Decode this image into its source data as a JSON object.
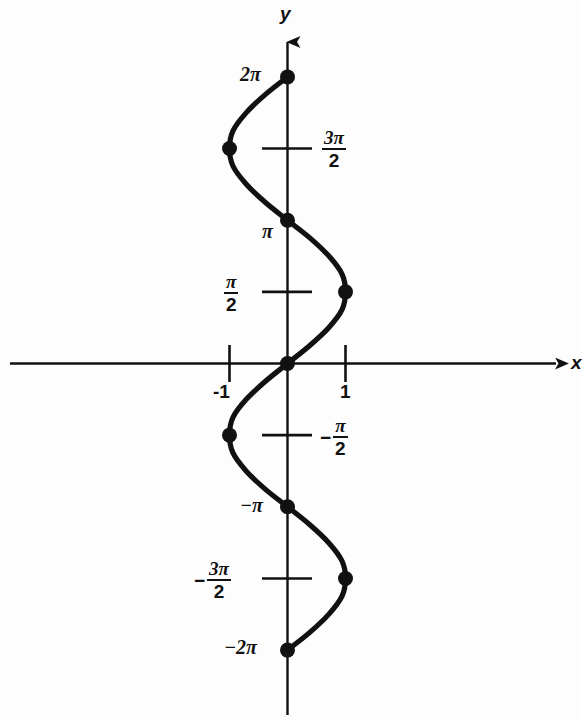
{
  "figure": {
    "background_color": "#fdfdfd",
    "ink_color": "#111111"
  },
  "axes": {
    "x_axis_label": "x",
    "y_axis_label": "y",
    "x_axis_has_arrow_right": true,
    "y_axis_has_arrow_up": true
  },
  "x_ticks": [
    {
      "label": "-1",
      "value": -1
    },
    {
      "label": "1",
      "value": 1
    }
  ],
  "y_ticks": [
    {
      "id": "two-pi",
      "text": "2π",
      "value": 6.2832,
      "kind": "plain"
    },
    {
      "id": "three-pi-over-two",
      "numerator": "3π",
      "denominator": "2",
      "value": 4.7124,
      "kind": "fraction"
    },
    {
      "id": "pi",
      "text": "π",
      "value": 3.1416,
      "kind": "plain"
    },
    {
      "id": "pi-over-two",
      "numerator": "π",
      "denominator": "2",
      "value": 1.5708,
      "kind": "fraction"
    },
    {
      "id": "neg-pi-over-two",
      "sign": "−",
      "numerator": "π",
      "denominator": "2",
      "value": -1.5708,
      "kind": "fraction"
    },
    {
      "id": "neg-pi",
      "text": "−π",
      "value": -3.1416,
      "kind": "plain"
    },
    {
      "id": "neg-three-pi-over-two",
      "sign": "−",
      "numerator": "3π",
      "denominator": "2",
      "value": -4.7124,
      "kind": "fraction"
    },
    {
      "id": "neg-two-pi",
      "text": "−2π",
      "value": -6.2832,
      "kind": "plain"
    }
  ],
  "chart_data": {
    "type": "line",
    "title": "",
    "xlabel": "x",
    "ylabel": "y",
    "xlim": [
      -4.75,
      4.9
    ],
    "ylim": [
      -7.35,
      7.35
    ],
    "grid": false,
    "legend": null,
    "relation": "x = sin(y)",
    "curve_points": [
      {
        "x": 0.0,
        "y": 6.2832
      },
      {
        "x": -0.38,
        "y": 5.9
      },
      {
        "x": -0.71,
        "y": 5.5
      },
      {
        "x": -0.94,
        "y": 5.1
      },
      {
        "x": -1.0,
        "y": 4.7124
      },
      {
        "x": -0.94,
        "y": 4.33
      },
      {
        "x": -0.71,
        "y": 3.93
      },
      {
        "x": -0.38,
        "y": 3.53
      },
      {
        "x": 0.0,
        "y": 3.1416
      },
      {
        "x": 0.38,
        "y": 2.76
      },
      {
        "x": 0.71,
        "y": 2.36
      },
      {
        "x": 0.94,
        "y": 1.96
      },
      {
        "x": 1.0,
        "y": 1.5708
      },
      {
        "x": 0.94,
        "y": 1.18
      },
      {
        "x": 0.71,
        "y": 0.785
      },
      {
        "x": 0.38,
        "y": 0.39
      },
      {
        "x": 0.0,
        "y": 0.0
      },
      {
        "x": -0.38,
        "y": -0.39
      },
      {
        "x": -0.71,
        "y": -0.785
      },
      {
        "x": -0.94,
        "y": -1.18
      },
      {
        "x": -1.0,
        "y": -1.5708
      },
      {
        "x": -0.94,
        "y": -1.96
      },
      {
        "x": -0.71,
        "y": -2.36
      },
      {
        "x": -0.38,
        "y": -2.76
      },
      {
        "x": 0.0,
        "y": -3.1416
      },
      {
        "x": 0.38,
        "y": -3.53
      },
      {
        "x": 0.71,
        "y": -3.93
      },
      {
        "x": 0.94,
        "y": -4.33
      },
      {
        "x": 1.0,
        "y": -4.7124
      },
      {
        "x": 0.94,
        "y": -5.1
      },
      {
        "x": 0.71,
        "y": -5.5
      },
      {
        "x": 0.38,
        "y": -5.9
      },
      {
        "x": 0.0,
        "y": -6.2832
      }
    ],
    "marked_points": [
      {
        "x": 0,
        "y": 6.2832,
        "label": "(0, 2π)"
      },
      {
        "x": -1,
        "y": 4.7124,
        "label": "(-1, 3π/2)"
      },
      {
        "x": 0,
        "y": 3.1416,
        "label": "(0, π)"
      },
      {
        "x": 1,
        "y": 1.5708,
        "label": "(1, π/2)"
      },
      {
        "x": 0,
        "y": 0,
        "label": "(0, 0)"
      },
      {
        "x": -1,
        "y": -1.5708,
        "label": "(-1, -π/2)"
      },
      {
        "x": 0,
        "y": -3.1416,
        "label": "(0, -π)"
      },
      {
        "x": 1,
        "y": -4.7124,
        "label": "(1, -3π/2)"
      },
      {
        "x": 0,
        "y": -6.2832,
        "label": "(0, -2π)"
      }
    ]
  }
}
